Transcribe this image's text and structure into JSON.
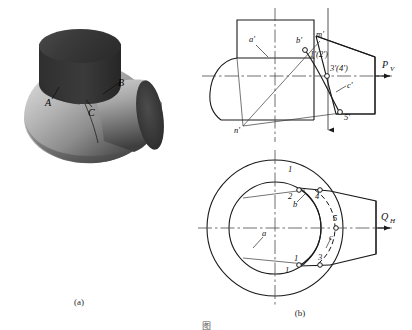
{
  "figure": {
    "caption_a": "(a)",
    "caption_b": "(b)",
    "caption_bottom": "图  ",
    "title_hidden": ""
  },
  "pictorial": {
    "name": "pictorial-view",
    "labels": [
      {
        "id": "A",
        "text": "A",
        "x": 47,
        "y": 101
      },
      {
        "id": "B",
        "text": "B",
        "x": 115,
        "y": 84
      },
      {
        "id": "C",
        "text": "C",
        "x": 89,
        "y": 110
      }
    ]
  },
  "front_view": {
    "name": "front-view",
    "plane_label": "P",
    "plane_sub": "V",
    "labels": [
      {
        "id": "a-prime",
        "text": "a'",
        "x": 252,
        "y": 40
      },
      {
        "id": "b-prime",
        "text": "b'",
        "x": 301,
        "y": 42
      },
      {
        "id": "m-prime",
        "text": "m'",
        "x": 321,
        "y": 37
      },
      {
        "id": "point-12",
        "text": "1'(2')",
        "x": 316,
        "y": 55
      },
      {
        "id": "point-34",
        "text": "3'(4')",
        "x": 333,
        "y": 70
      },
      {
        "id": "c-prime",
        "text": "c'",
        "x": 349,
        "y": 87
      },
      {
        "id": "point-5",
        "text": "5'",
        "x": 347,
        "y": 113
      },
      {
        "id": "n-prime",
        "text": "n'",
        "x": 237,
        "y": 128
      }
    ]
  },
  "top_view": {
    "name": "top-view",
    "plane_label": "Q",
    "plane_sub": "H",
    "labels": [
      {
        "id": "a",
        "text": "a",
        "x": 265,
        "y": 232
      },
      {
        "id": "b",
        "text": "b",
        "x": 296,
        "y": 200
      },
      {
        "id": "c",
        "text": "c",
        "x": 332,
        "y": 233
      },
      {
        "id": "point-1-top",
        "text": "1",
        "x": 290,
        "y": 168
      },
      {
        "id": "point-2",
        "text": "2",
        "x": 290,
        "y": 189
      },
      {
        "id": "point-4",
        "text": "4",
        "x": 312,
        "y": 189
      },
      {
        "id": "point-5-top",
        "text": "5",
        "x": 334,
        "y": 211
      },
      {
        "id": "point-3",
        "text": "3",
        "x": 320,
        "y": 240
      },
      {
        "id": "point-1b",
        "text": "1",
        "x": 296,
        "y": 238
      },
      {
        "id": "point-1c",
        "text": "1",
        "x": 287,
        "y": 255
      }
    ]
  },
  "colors": {
    "line": "#1a1a1a",
    "centerline": "#555555",
    "solid_dark": "#3c3c3c",
    "solid_mid": "#7d7d7d",
    "solid_light": "#c9c9c9",
    "background": "#ffffff"
  }
}
